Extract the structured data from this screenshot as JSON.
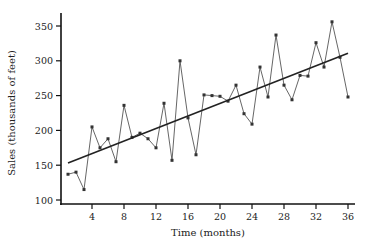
{
  "chart_data": {
    "type": "line",
    "title": "",
    "xlabel": "Time (months)",
    "ylabel": "Sales (thousands of feet)",
    "xlim": [
      0,
      37
    ],
    "ylim": [
      95,
      370
    ],
    "xticks": [
      4,
      8,
      12,
      16,
      20,
      24,
      28,
      32,
      36
    ],
    "yticks": [
      100,
      150,
      200,
      250,
      300,
      350
    ],
    "grid": false,
    "legend": null,
    "series": [
      {
        "name": "Sales",
        "style": "line+markers",
        "color": "#555555",
        "x": [
          1,
          2,
          3,
          4,
          5,
          6,
          7,
          8,
          9,
          10,
          11,
          12,
          13,
          14,
          15,
          16,
          17,
          18,
          19,
          20,
          21,
          22,
          23,
          24,
          25,
          26,
          27,
          28,
          29,
          30,
          31,
          32,
          33,
          34,
          35,
          36
        ],
        "values": [
          137,
          140,
          115,
          205,
          175,
          188,
          155,
          236,
          190,
          196,
          188,
          175,
          239,
          157,
          300,
          218,
          165,
          251,
          250,
          249,
          242,
          265,
          224,
          209,
          291,
          248,
          337,
          265,
          244,
          279,
          278,
          326,
          291,
          356,
          305,
          248
        ]
      },
      {
        "name": "Linear trend",
        "style": "line",
        "color": "#222222",
        "x": [
          1,
          36
        ],
        "values": [
          153,
          311
        ]
      }
    ]
  },
  "axes": {
    "x_title": "Time (months)",
    "y_title": "Sales (thousands of feet)"
  }
}
